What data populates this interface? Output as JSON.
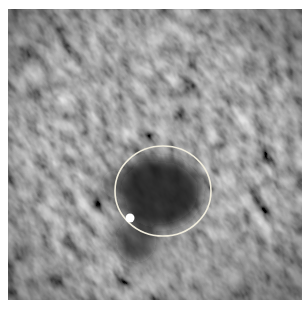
{
  "image": {
    "kind": "grayscale micrograph-like texture",
    "description": "Noisy gray texture with diagonal streaks, a dark irregular blob near center, annotated with a white circle and a small white marker dot",
    "colors": {
      "background": "#ffffff",
      "texture_base": "#4a4a4a",
      "texture_dark": "#2a2a2a",
      "texture_light": "#6e6e6e",
      "blob": "#1c1c1c",
      "annotation": "#f0ecdc",
      "marker": "#ffffff"
    }
  },
  "annotation": {
    "circle": {
      "cx": 155,
      "cy": 182,
      "rx": 48,
      "ry": 45,
      "stroke_width": 1.6
    },
    "marker": {
      "cx": 122,
      "cy": 209,
      "r": 4.5
    }
  }
}
